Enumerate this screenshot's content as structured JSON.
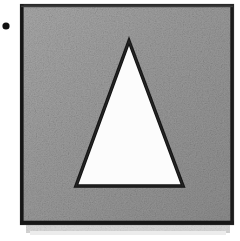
{
  "figure": {
    "kind": "scanned-geometric-figure",
    "description": "Gray textured square containing a white outlined triangle",
    "background_color": "#ffffff",
    "bullet": {
      "name": "bullet-dot",
      "shape": "circle",
      "color": "#121212",
      "cx": 6,
      "cy": 26,
      "r": 3.6
    },
    "square": {
      "name": "gray-square",
      "fill_color": "#9b9b9b",
      "fill_color_light": "#a9a9a9",
      "fill_color_dark": "#8d8d8d",
      "border_color": "#1a1a1a",
      "border_width": 3,
      "x": 21,
      "y": 5,
      "width": 212,
      "height": 219
    },
    "shadow": {
      "name": "drop-shadow-smudge",
      "color": "#d8d8d8",
      "x": 26,
      "y": 224,
      "width": 204,
      "height": 9
    },
    "triangle": {
      "name": "white-triangle",
      "fill_color": "#fcfcfc",
      "stroke_color": "#141414",
      "stroke_width": 3.5,
      "apex_x": 129,
      "apex_y": 41,
      "base_left_x": 76,
      "base_left_y": 186,
      "base_right_x": 183,
      "base_right_y": 186
    }
  }
}
